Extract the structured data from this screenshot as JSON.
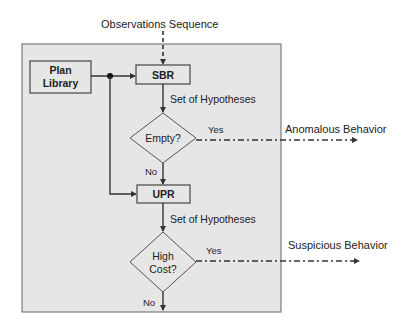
{
  "diagram": {
    "input_label": "Observations Sequence",
    "nodes": {
      "plan_library": {
        "line1": "Plan",
        "line2": "Library"
      },
      "sbr": {
        "label": "SBR"
      },
      "empty_decision": {
        "label": "Empty?"
      },
      "upr": {
        "label": "UPR"
      },
      "high_cost_decision": {
        "line1": "High",
        "line2": "Cost?"
      }
    },
    "edge_labels": {
      "sbr_output": "Set of Hypotheses",
      "upr_output": "Set of Hypotheses",
      "empty_yes": "Yes",
      "empty_no": "No",
      "cost_yes": "Yes",
      "cost_no": "No"
    },
    "outputs": {
      "anomalous": "Anomalous Behavior",
      "suspicious": "Suspicious Behavior"
    },
    "colors": {
      "panel_fill": "#e6e6e6",
      "panel_border": "#666666",
      "line": "#333333"
    }
  }
}
